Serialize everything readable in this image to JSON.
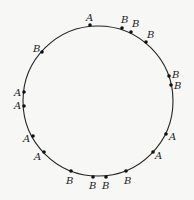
{
  "diagram": {
    "circle": {
      "cx": 98,
      "cy": 101,
      "r": 75,
      "stroke": "#222222"
    },
    "points": [
      {
        "label": "A",
        "x": 90,
        "y": 25,
        "lx": 86,
        "ly": 21
      },
      {
        "label": "B",
        "x": 122,
        "y": 28,
        "lx": 121,
        "ly": 23
      },
      {
        "label": "B",
        "x": 131,
        "y": 32,
        "lx": 132,
        "ly": 27
      },
      {
        "label": "B",
        "x": 146,
        "y": 42,
        "lx": 147,
        "ly": 38
      },
      {
        "label": "B",
        "x": 169,
        "y": 76,
        "lx": 172,
        "ly": 78
      },
      {
        "label": "B",
        "x": 171,
        "y": 85,
        "lx": 174,
        "ly": 89
      },
      {
        "label": "A",
        "x": 166,
        "y": 134,
        "lx": 169,
        "ly": 140
      },
      {
        "label": "A",
        "x": 153,
        "y": 152,
        "lx": 155,
        "ly": 159
      },
      {
        "label": "B",
        "x": 126,
        "y": 171,
        "lx": 124,
        "ly": 184
      },
      {
        "label": "B",
        "x": 106,
        "y": 177,
        "lx": 102,
        "ly": 189
      },
      {
        "label": "B",
        "x": 93,
        "y": 177,
        "lx": 89,
        "ly": 189
      },
      {
        "label": "B",
        "x": 71,
        "y": 171,
        "lx": 66,
        "ly": 184
      },
      {
        "label": "A",
        "x": 44,
        "y": 152,
        "lx": 34,
        "ly": 160
      },
      {
        "label": "A",
        "x": 33,
        "y": 136,
        "lx": 23,
        "ly": 142
      },
      {
        "label": "A",
        "x": 24,
        "y": 106,
        "lx": 14,
        "ly": 109
      },
      {
        "label": "A",
        "x": 24,
        "y": 92,
        "lx": 14,
        "ly": 96
      },
      {
        "label": "B",
        "x": 42,
        "y": 52,
        "lx": 33,
        "ly": 52
      }
    ]
  }
}
